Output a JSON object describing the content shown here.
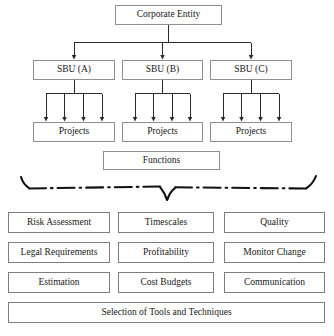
{
  "diagram": {
    "style": {
      "box_border": "#8a8a8a",
      "box_fill": "#ffffff",
      "connector": "#2b2b2b",
      "brace": "#111111",
      "background": "#ffffff"
    },
    "hierarchy": {
      "root": {
        "label": "Corporate Entity"
      },
      "units": [
        {
          "label": "SBU (A)",
          "children_count": 4,
          "child_label": "Projects"
        },
        {
          "label": "SBU (B)",
          "children_count": 4,
          "child_label": "Projects"
        },
        {
          "label": "SBU (C)",
          "children_count": 4,
          "child_label": "Projects"
        }
      ],
      "projects": [
        {
          "label": "Projects"
        },
        {
          "label": "Projects"
        },
        {
          "label": "Projects"
        }
      ],
      "functions": {
        "label": "Functions"
      }
    },
    "brace": {
      "name": "dash-dot-brace",
      "style": "dash-dot",
      "orientation": "downward-point-center"
    },
    "topics": {
      "rows": [
        {
          "cells": [
            "Risk Assessment",
            "Timescales",
            "Quality"
          ]
        },
        {
          "cells": [
            "Legal Requirements",
            "Profitability",
            "Monitor Change"
          ]
        },
        {
          "cells": [
            "Estimation",
            "Cost Budgets",
            "Communication"
          ]
        }
      ],
      "footer": {
        "label": "Selection of Tools and Techniques"
      }
    }
  }
}
